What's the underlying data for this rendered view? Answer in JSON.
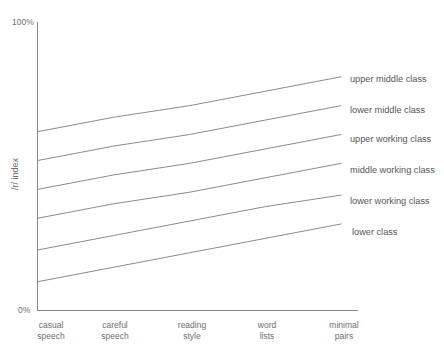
{
  "chart_data": {
    "type": "line",
    "title": "",
    "subtitle": "",
    "xlabel": "",
    "ylabel": "/r/ index",
    "ylim": [
      0,
      100
    ],
    "ytick_labels": [
      "100%",
      "0%"
    ],
    "ytick_values": [
      100,
      0
    ],
    "grid": false,
    "legend_position": "right-inline-labels",
    "categories": [
      "casual speech",
      "careful speech",
      "reading style",
      "word lists",
      "minimal pairs"
    ],
    "categories_lines": [
      [
        "casual",
        "speech"
      ],
      [
        "careful",
        "speech"
      ],
      [
        "reading",
        "style"
      ],
      [
        "word",
        "lists"
      ],
      [
        "minimal",
        "pairs"
      ]
    ],
    "series": [
      {
        "name": "upper middle class",
        "values": [
          62,
          67,
          71,
          76,
          81
        ]
      },
      {
        "name": "lower middle class",
        "values": [
          52,
          57,
          61,
          66,
          71
        ]
      },
      {
        "name": "upper working class",
        "values": [
          42,
          47,
          51,
          56,
          61
        ]
      },
      {
        "name": "middle working class",
        "values": [
          32,
          37,
          41,
          46,
          51
        ]
      },
      {
        "name": "lower working class",
        "values": [
          21,
          26,
          31,
          36,
          40
        ]
      },
      {
        "name": "lower class",
        "values": [
          10,
          15,
          20,
          25,
          30
        ]
      }
    ],
    "colors": {
      "line": "#7d7d7d",
      "axis": "#8a8a8a",
      "text": "#6e6e6e",
      "legend_text": "#555555",
      "background": "#ffffff"
    }
  }
}
